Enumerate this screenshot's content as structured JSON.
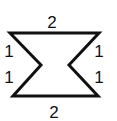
{
  "diagram": {
    "type": "polygon",
    "stroke_color": "#111111",
    "background": "#ffffff",
    "vertices": [
      [
        10,
        33
      ],
      [
        99,
        33
      ],
      [
        69,
        65
      ],
      [
        98,
        96
      ],
      [
        13,
        96
      ],
      [
        41,
        65
      ]
    ],
    "edges": [
      {
        "name": "top",
        "label": "2"
      },
      {
        "name": "right-upper",
        "label": "1"
      },
      {
        "name": "right-lower",
        "label": "1"
      },
      {
        "name": "bottom",
        "label": "2"
      },
      {
        "name": "left-lower",
        "label": "1"
      },
      {
        "name": "left-upper",
        "label": "1"
      }
    ]
  }
}
